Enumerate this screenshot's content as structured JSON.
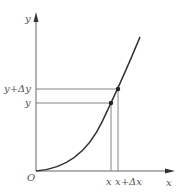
{
  "diagram": {
    "type": "function-increment-plot",
    "labels": {
      "y_axis": "y",
      "x_axis": "x",
      "origin": "O",
      "y_value": "y",
      "y_plus_dy": "y+Δy",
      "x_value": "x",
      "x_plus_dx": "x+Δx"
    },
    "colors": {
      "axis": "#666666",
      "curve": "#333333",
      "guide_lines": "#777777",
      "points": "#222222",
      "labels": "#555555"
    },
    "points": [
      {
        "name": "point-x-y",
        "label": "(x, y)"
      },
      {
        "name": "point-xdx-ydy",
        "label": "(x+Δx, y+Δy)"
      }
    ]
  }
}
